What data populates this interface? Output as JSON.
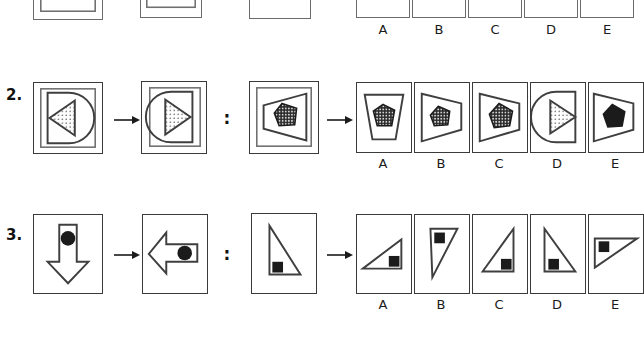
{
  "page": {
    "background": "#ffffff",
    "width": 633,
    "height": 340,
    "stroke_color": "#3f3f3f",
    "frame_color": "#6b6b6b",
    "fill_dark": "#1b1b1b",
    "type": "visual-analogy-reasoning-test"
  },
  "separators": {
    "arrow": "right-arrow",
    "colon": ":"
  },
  "option_letters": [
    "A",
    "B",
    "C",
    "D",
    "E"
  ],
  "rows": [
    {
      "id": "row1",
      "number": "",
      "visible": "partial-bottom-edge-only",
      "prompt_panels": [
        {
          "name": "row1-prompt-a",
          "content": "cropped"
        },
        {
          "name": "row1-prompt-b",
          "content": "cropped"
        },
        {
          "name": "row1-prompt-c",
          "content": "cropped"
        }
      ],
      "options": [
        {
          "letter": "A",
          "content": "cropped"
        },
        {
          "letter": "B",
          "content": "cropped"
        },
        {
          "letter": "C",
          "content": "cropped"
        },
        {
          "letter": "D",
          "content": "cropped"
        },
        {
          "letter": "E",
          "content": "cropped"
        }
      ]
    },
    {
      "id": "row2",
      "number": "2.",
      "prompt_panels": [
        {
          "name": "row2-prompt-a",
          "content": "d-shape-semicircle-right-with-left-pointing-dotted-triangle"
        },
        {
          "name": "row2-prompt-b",
          "content": "d-shape-semicircle-left-with-right-pointing-dotted-triangle"
        },
        {
          "name": "row2-prompt-c",
          "content": "trapezoid-wide-right-with-dark-textured-pentagon"
        }
      ],
      "options": [
        {
          "letter": "A",
          "content": "trapezoid-narrow-bottom-with-dark-textured-pentagon"
        },
        {
          "letter": "B",
          "content": "trapezoid-wide-left-with-dark-textured-pentagon"
        },
        {
          "letter": "C",
          "content": "trapezoid-wide-left-with-dark-textured-pentagon-larger"
        },
        {
          "letter": "D",
          "content": "d-shape-semicircle-left-with-right-pointing-dotted-triangle"
        },
        {
          "letter": "E",
          "content": "trapezoid-wide-left-with-solid-black-pentagon"
        }
      ]
    },
    {
      "id": "row3",
      "number": "3.",
      "prompt_panels": [
        {
          "name": "row3-prompt-a",
          "content": "down-arrow-with-black-circle"
        },
        {
          "name": "row3-prompt-b",
          "content": "left-arrow-with-black-circle"
        },
        {
          "name": "row3-prompt-c",
          "content": "right-triangle-vertical-left-edge-with-black-square-bottom-left"
        }
      ],
      "options": [
        {
          "letter": "A",
          "content": "right-triangle-flat-bottom-rising-right-with-black-square"
        },
        {
          "letter": "B",
          "content": "narrow-triangle-apex-bottom-left-with-black-square-top"
        },
        {
          "letter": "C",
          "content": "right-triangle-vertical-right-edge-with-black-square-bottom"
        },
        {
          "letter": "D",
          "content": "right-triangle-vertical-left-edge-with-black-square-bottom"
        },
        {
          "letter": "E",
          "content": "right-triangle-flat-top-with-black-square-top-left"
        }
      ]
    }
  ]
}
